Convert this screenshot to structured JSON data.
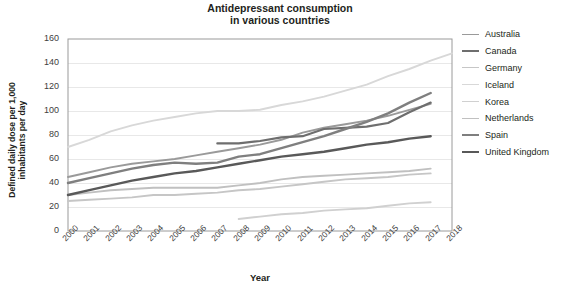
{
  "chart_data": {
    "type": "line",
    "title": "Antidepressant consumption\nin various countries",
    "xlabel": "Year",
    "ylabel": "Defined daily dose per 1,000\ninhabitants per day",
    "grid": true,
    "legend_position": "right",
    "xlim": [
      2000,
      2018
    ],
    "ylim": [
      0,
      160
    ],
    "ytick_labels": [
      "160",
      "140",
      "120",
      "100",
      "80",
      "60",
      "40",
      "20",
      "0"
    ],
    "yticks": [
      160,
      140,
      120,
      100,
      80,
      60,
      40,
      20,
      0
    ],
    "x": [
      2000,
      2001,
      2002,
      2003,
      2004,
      2005,
      2006,
      2007,
      2008,
      2009,
      2010,
      2011,
      2012,
      2013,
      2014,
      2015,
      2016,
      2017,
      2018
    ],
    "xtick_labels": [
      "2000",
      "2001",
      "2002",
      "2003",
      "2004",
      "2005",
      "2006",
      "2007",
      "2008",
      "2009",
      "2010",
      "2011",
      "2012",
      "2013",
      "2014",
      "2015",
      "2016",
      "2017",
      "2018"
    ],
    "series": [
      {
        "name": "Australia",
        "color": "#9a9a9a",
        "width": 1.9,
        "x": [
          2000,
          2001,
          2002,
          2003,
          2004,
          2005,
          2006,
          2007,
          2008,
          2009,
          2010,
          2011,
          2012,
          2013,
          2014,
          2015,
          2016,
          2017
        ],
        "values": [
          45,
          49,
          53,
          56,
          58,
          60,
          63,
          66,
          69,
          72,
          76,
          82,
          86,
          89,
          92,
          96,
          101,
          106
        ]
      },
      {
        "name": "Canada",
        "color": "#6e6e6e",
        "width": 2.2,
        "x": [
          2007,
          2008,
          2009,
          2010,
          2011,
          2012,
          2013,
          2014,
          2015,
          2016,
          2017
        ],
        "values": [
          73,
          73,
          75,
          78,
          79,
          85,
          86,
          87,
          90,
          99,
          107
        ]
      },
      {
        "name": "Germany",
        "color": "#c6c6c6",
        "width": 1.9,
        "x": [
          2000,
          2001,
          2002,
          2003,
          2004,
          2005,
          2006,
          2007,
          2008,
          2009,
          2010,
          2011,
          2012,
          2013,
          2014,
          2015,
          2016,
          2017
        ],
        "values": [
          25,
          26,
          27,
          28,
          30,
          30,
          31,
          32,
          34,
          35,
          37,
          39,
          41,
          43,
          44,
          45,
          47,
          48
        ]
      },
      {
        "name": "Iceland",
        "color": "#d8d8d8",
        "width": 1.9,
        "x": [
          2000,
          2001,
          2002,
          2003,
          2004,
          2005,
          2006,
          2007,
          2008,
          2009,
          2010,
          2011,
          2012,
          2013,
          2014,
          2015,
          2016,
          2017,
          2018
        ],
        "values": [
          70,
          76,
          83,
          88,
          92,
          95,
          98,
          100,
          100,
          101,
          105,
          108,
          112,
          117,
          122,
          129,
          135,
          142,
          148
        ]
      },
      {
        "name": "Korea",
        "color": "#d0d0d0",
        "width": 1.9,
        "x": [
          2008,
          2009,
          2010,
          2011,
          2012,
          2013,
          2014,
          2015,
          2016,
          2017
        ],
        "values": [
          10,
          12,
          14,
          15,
          17,
          18,
          19,
          21,
          23,
          24
        ]
      },
      {
        "name": "Netherlands",
        "color": "#c0c0c0",
        "width": 1.9,
        "x": [
          2000,
          2001,
          2002,
          2003,
          2004,
          2005,
          2006,
          2007,
          2008,
          2009,
          2010,
          2011,
          2012,
          2013,
          2014,
          2015,
          2016,
          2017
        ],
        "values": [
          30,
          32,
          34,
          35,
          36,
          36,
          36,
          36,
          38,
          40,
          43,
          45,
          46,
          47,
          48,
          49,
          50,
          52
        ]
      },
      {
        "name": "Spain",
        "color": "#7f7f7f",
        "width": 2.4,
        "x": [
          2000,
          2001,
          2002,
          2003,
          2004,
          2005,
          2006,
          2007,
          2008,
          2009,
          2010,
          2011,
          2012,
          2013,
          2014,
          2015,
          2016,
          2017
        ],
        "values": [
          40,
          44,
          48,
          52,
          55,
          57,
          56,
          57,
          62,
          64,
          69,
          74,
          79,
          85,
          91,
          98,
          107,
          115
        ]
      },
      {
        "name": "United Kingdom",
        "color": "#595959",
        "width": 2.4,
        "x": [
          2000,
          2001,
          2002,
          2003,
          2004,
          2005,
          2006,
          2007,
          2008,
          2009,
          2010,
          2011,
          2012,
          2013,
          2014,
          2015,
          2016,
          2017
        ],
        "values": [
          30,
          34,
          38,
          42,
          45,
          48,
          50,
          53,
          56,
          59,
          62,
          64,
          66,
          69,
          72,
          74,
          77,
          79
        ]
      }
    ]
  },
  "legend": {
    "items": [
      {
        "label": "Australia"
      },
      {
        "label": "Canada"
      },
      {
        "label": "Germany"
      },
      {
        "label": "Iceland"
      },
      {
        "label": "Korea"
      },
      {
        "label": "Netherlands"
      },
      {
        "label": "Spain"
      },
      {
        "label": "United Kingdom"
      }
    ]
  }
}
